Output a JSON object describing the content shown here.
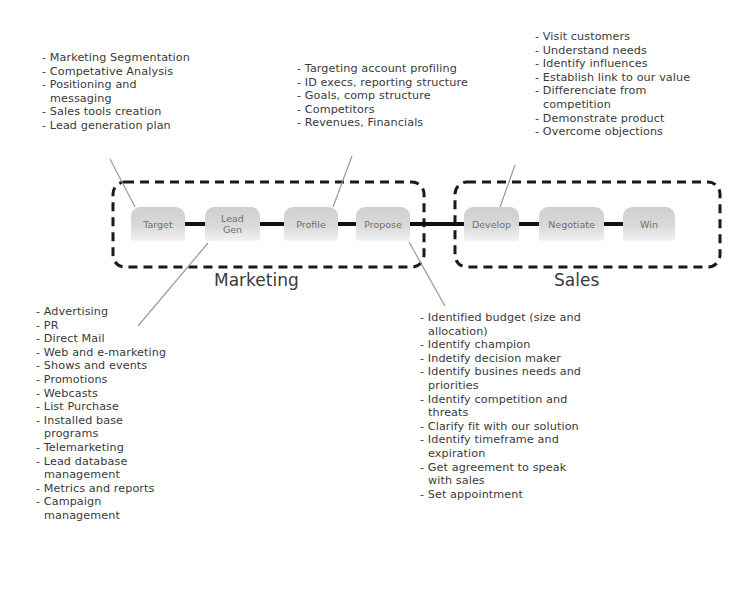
{
  "stages": [
    {
      "label": "Target"
    },
    {
      "label": "Lead Gen"
    },
    {
      "label": "Profile"
    },
    {
      "label": "Propose"
    },
    {
      "label": "Develop"
    },
    {
      "label": "Negotiate"
    },
    {
      "label": "Win"
    }
  ],
  "groups": {
    "marketing": {
      "label": "Marketing"
    },
    "sales": {
      "label": "Sales"
    }
  },
  "lists": {
    "target": [
      "Marketing Segmentation",
      "Competative Analysis",
      "Positioning and messaging",
      "Sales tools creation",
      "Lead generation plan"
    ],
    "profile": [
      "Targeting account profiling",
      "ID execs, reporting structure",
      "Goals, comp structure",
      "Competitors",
      "Revenues, Financials"
    ],
    "develop": [
      "Visit customers",
      "Understand needs",
      "Identify influences",
      "Establish link to our value",
      "Differenciate from competition",
      "Demonstrate product",
      "Overcome objections"
    ],
    "lead_gen": [
      "Advertising",
      "PR",
      "Direct Mail",
      "Web and e-marketing",
      "Shows and events",
      "Promotions",
      "Webcasts",
      "List Purchase",
      "Installed base programs",
      "Telemarketing",
      "Lead database management",
      "Metrics and reports",
      "Campaign management"
    ],
    "propose": [
      "Identified budget (size and allocation)",
      "Identify champion",
      "Indetify decision maker",
      "Identify busines needs and priorities",
      "Identify competition and threats",
      "Clarify fit with our solution",
      "Identify timeframe and expiration",
      "Get agreement to speak with sales",
      "Set appointment"
    ]
  }
}
